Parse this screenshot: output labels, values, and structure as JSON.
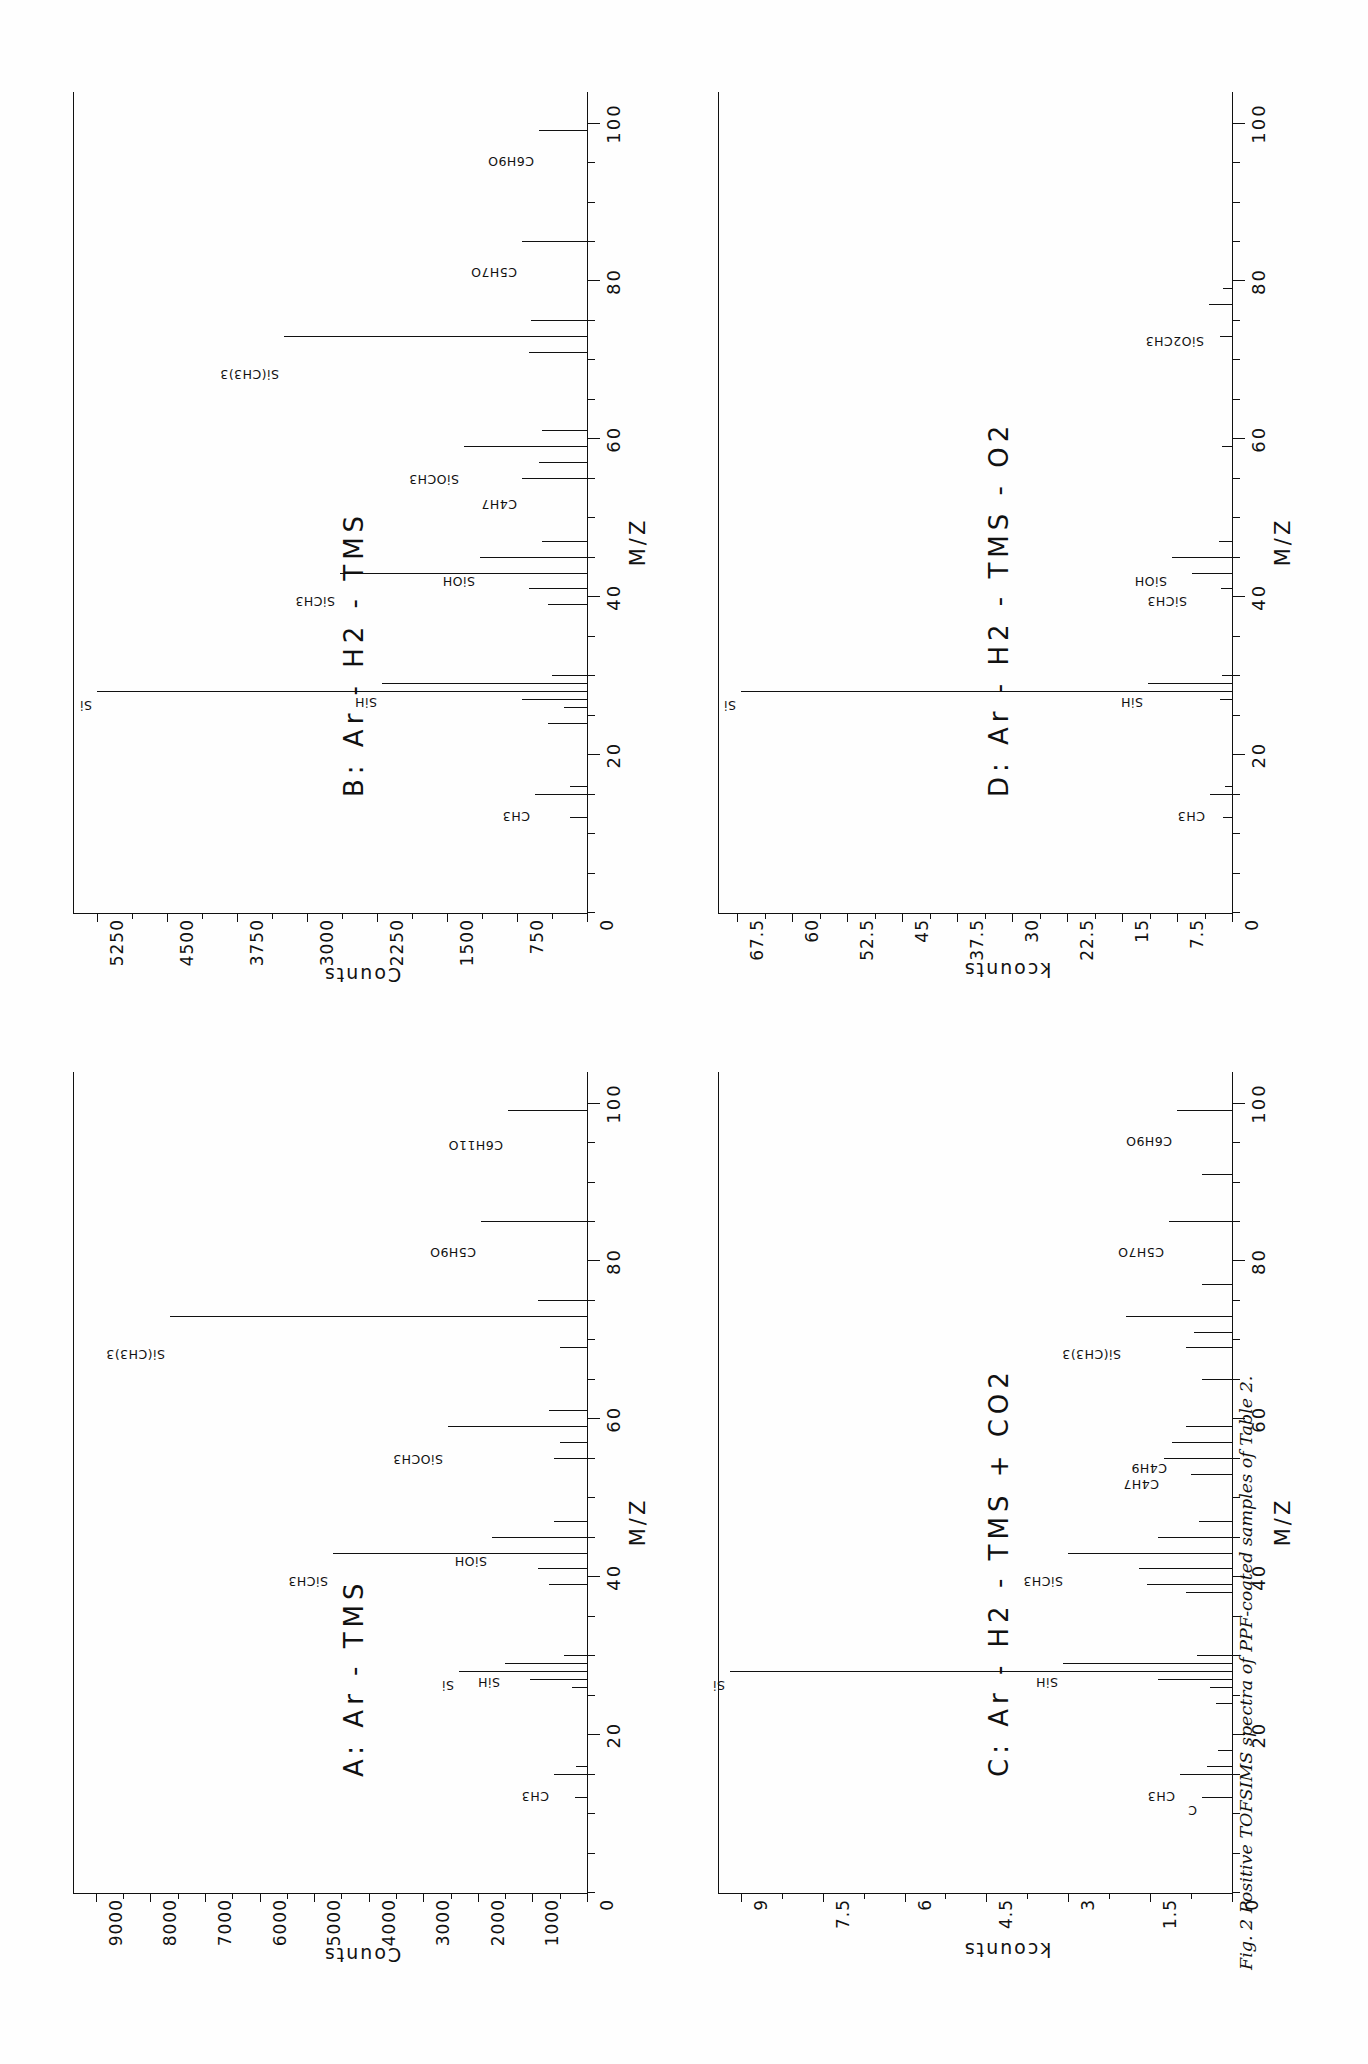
{
  "figure": {
    "caption": "Fig. 2 Positive TOFSIMS spectra of PPF-coated samples of Table 2."
  },
  "chart_data": [
    {
      "id": "A",
      "type": "bar",
      "title": "A:  Ar - TMS",
      "xlabel": "M/Z",
      "ylabel": "Counts",
      "xlim": [
        0,
        104
      ],
      "ylim": [
        0,
        9400
      ],
      "xticks": [
        20,
        40,
        60,
        80,
        100
      ],
      "yticks": [
        0,
        1000,
        2000,
        3000,
        4000,
        5000,
        6000,
        7000,
        8000,
        9000
      ],
      "ytick_labels": [
        "0",
        "1000",
        "2000",
        "3000",
        "4000",
        "5000",
        "6000",
        "7000",
        "8000",
        "9000"
      ],
      "grid": false,
      "peaks": [
        {
          "mz": 12,
          "value": 220,
          "label": ""
        },
        {
          "mz": 15,
          "value": 600,
          "label": "CH3"
        },
        {
          "mz": 16,
          "value": 200,
          "label": ""
        },
        {
          "mz": 26,
          "value": 280,
          "label": ""
        },
        {
          "mz": 27,
          "value": 1050,
          "label": ""
        },
        {
          "mz": 28,
          "value": 2350,
          "label": "Si"
        },
        {
          "mz": 29,
          "value": 1500,
          "label": "SiH"
        },
        {
          "mz": 30,
          "value": 430,
          "label": ""
        },
        {
          "mz": 39,
          "value": 700,
          "label": ""
        },
        {
          "mz": 41,
          "value": 900,
          "label": ""
        },
        {
          "mz": 43,
          "value": 4650,
          "label": "SiCH3"
        },
        {
          "mz": 45,
          "value": 1750,
          "label": "SiOH"
        },
        {
          "mz": 47,
          "value": 600,
          "label": ""
        },
        {
          "mz": 55,
          "value": 600,
          "label": ""
        },
        {
          "mz": 57,
          "value": 500,
          "label": ""
        },
        {
          "mz": 59,
          "value": 2550,
          "label": "SiOCH3"
        },
        {
          "mz": 61,
          "value": 700,
          "label": ""
        },
        {
          "mz": 69,
          "value": 500,
          "label": ""
        },
        {
          "mz": 73,
          "value": 7650,
          "label": "Si(CH3)3"
        },
        {
          "mz": 75,
          "value": 900,
          "label": ""
        },
        {
          "mz": 85,
          "value": 1950,
          "label": "C5H9O"
        },
        {
          "mz": 99,
          "value": 1450,
          "label": "C6H11O"
        }
      ]
    },
    {
      "id": "B",
      "type": "bar",
      "title": "B:  Ar - H2 - TMS",
      "xlabel": "M/Z",
      "ylabel": "Counts",
      "xlim": [
        0,
        104
      ],
      "ylim": [
        0,
        5500
      ],
      "xticks": [
        20,
        40,
        60,
        80,
        100
      ],
      "yticks": [
        0,
        750,
        1500,
        2250,
        3000,
        3750,
        4500,
        5250
      ],
      "ytick_labels": [
        "0",
        "750",
        "1500",
        "2250",
        "3000",
        "3750",
        "4500",
        "5250"
      ],
      "grid": false,
      "peaks": [
        {
          "mz": 12,
          "value": 180,
          "label": ""
        },
        {
          "mz": 15,
          "value": 560,
          "label": "CH3"
        },
        {
          "mz": 16,
          "value": 180,
          "label": ""
        },
        {
          "mz": 24,
          "value": 420,
          "label": ""
        },
        {
          "mz": 26,
          "value": 250,
          "label": ""
        },
        {
          "mz": 27,
          "value": 700,
          "label": ""
        },
        {
          "mz": 28,
          "value": 5250,
          "label": "Si"
        },
        {
          "mz": 29,
          "value": 2200,
          "label": "SiH"
        },
        {
          "mz": 30,
          "value": 380,
          "label": ""
        },
        {
          "mz": 39,
          "value": 420,
          "label": ""
        },
        {
          "mz": 41,
          "value": 620,
          "label": ""
        },
        {
          "mz": 43,
          "value": 2650,
          "label": "SiCH3"
        },
        {
          "mz": 45,
          "value": 1150,
          "label": "SiOH"
        },
        {
          "mz": 47,
          "value": 480,
          "label": ""
        },
        {
          "mz": 55,
          "value": 700,
          "label": "C4H7"
        },
        {
          "mz": 57,
          "value": 520,
          "label": ""
        },
        {
          "mz": 59,
          "value": 1320,
          "label": "SiOCH3"
        },
        {
          "mz": 61,
          "value": 480,
          "label": ""
        },
        {
          "mz": 71,
          "value": 620,
          "label": ""
        },
        {
          "mz": 73,
          "value": 3250,
          "label": "Si(CH3)3"
        },
        {
          "mz": 75,
          "value": 600,
          "label": ""
        },
        {
          "mz": 85,
          "value": 700,
          "label": "C5H7O"
        },
        {
          "mz": 99,
          "value": 520,
          "label": "C6H9O"
        }
      ]
    },
    {
      "id": "C",
      "type": "bar",
      "title": "C:  Ar - H2 - TMS + CO2",
      "xlabel": "M/Z",
      "ylabel": "kcounts",
      "xlim": [
        0,
        104
      ],
      "ylim": [
        0,
        9.4
      ],
      "xticks": [
        20,
        40,
        60,
        80,
        100
      ],
      "yticks": [
        0,
        1.5,
        3,
        4.5,
        6,
        7.5,
        9
      ],
      "ytick_labels": [
        "0",
        "1.5",
        "3",
        "4.5",
        "6",
        "7.5",
        "9"
      ],
      "grid": false,
      "peaks": [
        {
          "mz": 12,
          "value": 0.55,
          "label": "C"
        },
        {
          "mz": 15,
          "value": 0.95,
          "label": "CH3"
        },
        {
          "mz": 16,
          "value": 0.45,
          "label": ""
        },
        {
          "mz": 18,
          "value": 0.25,
          "label": ""
        },
        {
          "mz": 24,
          "value": 0.3,
          "label": ""
        },
        {
          "mz": 26,
          "value": 0.4,
          "label": ""
        },
        {
          "mz": 27,
          "value": 1.35,
          "label": ""
        },
        {
          "mz": 28,
          "value": 9.2,
          "label": "Si"
        },
        {
          "mz": 29,
          "value": 3.1,
          "label": "SiH"
        },
        {
          "mz": 30,
          "value": 0.65,
          "label": ""
        },
        {
          "mz": 38,
          "value": 0.85,
          "label": ""
        },
        {
          "mz": 39,
          "value": 1.55,
          "label": ""
        },
        {
          "mz": 41,
          "value": 1.7,
          "label": ""
        },
        {
          "mz": 43,
          "value": 3.0,
          "label": "SiCH3"
        },
        {
          "mz": 45,
          "value": 1.35,
          "label": ""
        },
        {
          "mz": 47,
          "value": 0.6,
          "label": ""
        },
        {
          "mz": 53,
          "value": 0.75,
          "label": ""
        },
        {
          "mz": 55,
          "value": 1.25,
          "label": "C4H7"
        },
        {
          "mz": 57,
          "value": 1.1,
          "label": "C4H9"
        },
        {
          "mz": 59,
          "value": 0.85,
          "label": ""
        },
        {
          "mz": 65,
          "value": 0.55,
          "label": ""
        },
        {
          "mz": 69,
          "value": 0.85,
          "label": ""
        },
        {
          "mz": 71,
          "value": 0.7,
          "label": ""
        },
        {
          "mz": 73,
          "value": 1.95,
          "label": "Si(CH3)3"
        },
        {
          "mz": 77,
          "value": 0.55,
          "label": ""
        },
        {
          "mz": 85,
          "value": 1.15,
          "label": "C5H7O"
        },
        {
          "mz": 91,
          "value": 0.55,
          "label": ""
        },
        {
          "mz": 99,
          "value": 1.0,
          "label": "C6H9O"
        }
      ]
    },
    {
      "id": "D",
      "type": "bar",
      "title": "D:  Ar - H2 - TMS - O2",
      "xlabel": "M/Z",
      "ylabel": "kcounts",
      "xlim": [
        0,
        104
      ],
      "ylim": [
        0,
        70
      ],
      "xticks": [
        20,
        40,
        60,
        80,
        100
      ],
      "yticks": [
        0,
        7.5,
        15,
        22.5,
        30,
        37.5,
        45,
        52.5,
        60,
        67.5
      ],
      "ytick_labels": [
        "0",
        "7.5",
        "15",
        "22.5",
        "30",
        "37.5",
        "45",
        "52.5",
        "60",
        "67.5"
      ],
      "grid": false,
      "peaks": [
        {
          "mz": 12,
          "value": 1.2,
          "label": ""
        },
        {
          "mz": 15,
          "value": 3.0,
          "label": "CH3"
        },
        {
          "mz": 16,
          "value": 1.0,
          "label": ""
        },
        {
          "mz": 27,
          "value": 1.6,
          "label": ""
        },
        {
          "mz": 28,
          "value": 67.0,
          "label": "Si"
        },
        {
          "mz": 29,
          "value": 11.5,
          "label": "SiH"
        },
        {
          "mz": 30,
          "value": 1.4,
          "label": ""
        },
        {
          "mz": 41,
          "value": 1.5,
          "label": ""
        },
        {
          "mz": 43,
          "value": 5.5,
          "label": "SiCH3"
        },
        {
          "mz": 45,
          "value": 8.2,
          "label": "SiOH"
        },
        {
          "mz": 47,
          "value": 1.8,
          "label": ""
        },
        {
          "mz": 59,
          "value": 1.3,
          "label": ""
        },
        {
          "mz": 73,
          "value": 1.6,
          "label": ""
        },
        {
          "mz": 77,
          "value": 3.2,
          "label": "SiO2CH3"
        },
        {
          "mz": 79,
          "value": 1.2,
          "label": ""
        }
      ]
    }
  ]
}
